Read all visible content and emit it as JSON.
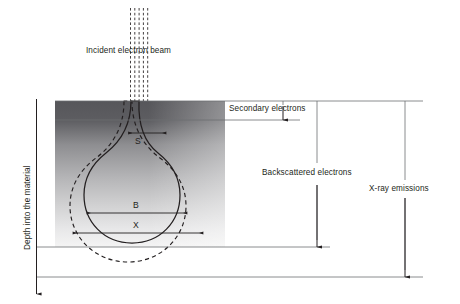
{
  "figure": {
    "type": "schematic-diagram"
  },
  "labels": {
    "incident_beam": "Incident electron beam",
    "depth_axis": "Depth into the material",
    "secondary_electrons": "Secondary electrons",
    "backscattered_electrons": "Backscattered electrons",
    "xray_emissions": "X-ray emissions"
  },
  "symbols": {
    "s": "S",
    "b": "B",
    "x": "X"
  },
  "colors": {
    "ink": "#231f20",
    "line": "#58595b",
    "material_top": "#56565a",
    "material_bottom": "#f2f2f2",
    "background": "#ffffff"
  },
  "regions": {
    "material_block": {
      "left": 55,
      "top": 101,
      "width": 170,
      "height": 146
    }
  },
  "markers": {
    "beam_dash_count": 5,
    "secondary_depth_line_y": 120,
    "backscatter_depth_line_y": 247,
    "xray_depth_line_y": 277
  }
}
